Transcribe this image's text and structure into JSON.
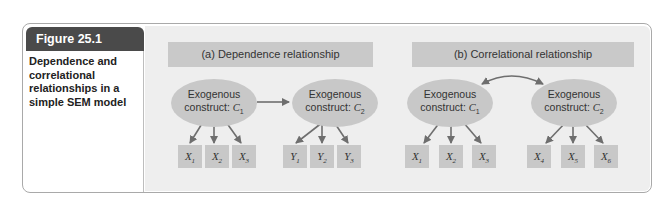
{
  "figure": {
    "label": "Figure 25.1",
    "caption": "Dependence and correlational relationships in a simple SEM model"
  },
  "colors": {
    "tab_bg": "#4a4a4a",
    "panel_bg": "#eeeeee",
    "header_bg": "#c9c9c9",
    "node_bg": "#c8c8c8",
    "arrow": "#6e6e6e"
  },
  "panel_a": {
    "title": "(a) Dependence relationship",
    "constructs": [
      {
        "text": "Exogenous",
        "line2": "construct: ",
        "var": "C",
        "sub": "1"
      },
      {
        "text": "Exogenous",
        "line2": "construct: ",
        "var": "C",
        "sub": "2"
      }
    ],
    "relationship": "directed arrow C1 → C2",
    "indicators": [
      {
        "var": "X",
        "sub": "1"
      },
      {
        "var": "X",
        "sub": "2"
      },
      {
        "var": "X",
        "sub": "3"
      },
      {
        "var": "Y",
        "sub": "1"
      },
      {
        "var": "Y",
        "sub": "2"
      },
      {
        "var": "Y",
        "sub": "3"
      }
    ]
  },
  "panel_b": {
    "title": "(b) Correlational relationship",
    "constructs": [
      {
        "text": "Exogenous",
        "line2": "construct: ",
        "var": "C",
        "sub": "1"
      },
      {
        "text": "Exogenous",
        "line2": "construct: ",
        "var": "C",
        "sub": "2"
      }
    ],
    "relationship": "curved double-headed arrow C1 ↔ C2",
    "indicators": [
      {
        "var": "X",
        "sub": "1"
      },
      {
        "var": "X",
        "sub": "2"
      },
      {
        "var": "X",
        "sub": "3"
      },
      {
        "var": "X",
        "sub": "4"
      },
      {
        "var": "X",
        "sub": "5"
      },
      {
        "var": "X",
        "sub": "6"
      }
    ]
  }
}
